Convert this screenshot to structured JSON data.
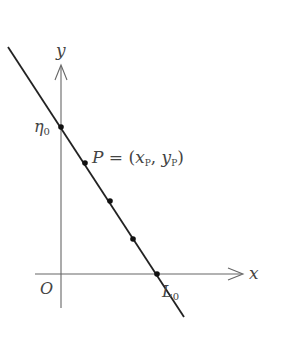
{
  "diagram": {
    "type": "line-intercept-plot",
    "axes": {
      "x_label": "x",
      "y_label": "y",
      "origin_label": "O"
    },
    "line": {
      "description": "straight line with negative slope crossing y-axis at η0 and x-axis at L0",
      "marked_points_count": 5
    },
    "labels": {
      "y_intercept": {
        "main": "η",
        "sub": "0"
      },
      "x_intercept": {
        "main": "L",
        "sub": "0"
      },
      "point": {
        "name": "P",
        "eq": " = (",
        "x_main": "x",
        "x_sub": "P",
        "comma": ",  ",
        "y_main": "y",
        "y_sub": "P",
        "close": ")"
      }
    },
    "colors": {
      "line": "#222222",
      "axis": "#666666",
      "text": "#444444",
      "background": "#ffffff"
    }
  }
}
